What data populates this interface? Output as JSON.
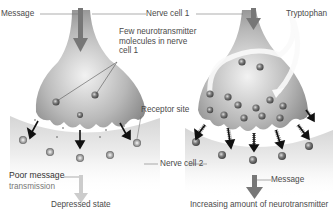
{
  "labels": {
    "message_top": "Message",
    "nerve_cell_1": "Nerve cell 1",
    "tryptophan": "Tryptophan",
    "few_neuro_line1": "Few neurotransmitter",
    "few_neuro_line2": "molecules in nerve",
    "few_neuro_line3": "cell 1",
    "receptor_site": "Receptor site",
    "nerve_cell_2": "Nerve cell 2",
    "poor_message_line1": "Poor message",
    "poor_message_line2": "transmission",
    "depressed_state": "Depressed state",
    "message_bottom": "Message",
    "increasing": "Increasing amount of neurotransmitter"
  },
  "colors": {
    "cell_gray": "#9a9a9a",
    "cell_light": "#e6e6e6",
    "arrow_gray": "#777777",
    "arrow_light": "#cccccc",
    "molecule": "#6a6a6a",
    "text": "#4a4a4a"
  }
}
